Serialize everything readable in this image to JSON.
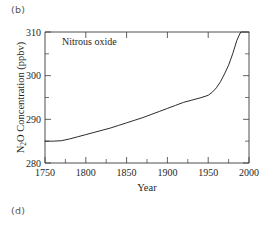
{
  "figure": {
    "panel_label_b": "(b)",
    "panel_label_d": "(d)"
  },
  "chart_data": {
    "type": "line",
    "title": "",
    "annotation": "Nitrous oxide",
    "xlabel": "Year",
    "ylabel_prefix": "N",
    "ylabel_subscript": "2",
    "ylabel_suffix": "O Concentration (ppbv)",
    "ylabel_full": "N2O Concentration (ppbv)",
    "xlim": [
      1750,
      2000
    ],
    "ylim": [
      280,
      310
    ],
    "grid": false,
    "legend": "none",
    "xticks": [
      1750,
      1800,
      1850,
      1900,
      1950,
      2000
    ],
    "xtick_labels": [
      "1750",
      "1800",
      "1850",
      "1900",
      "1950",
      "2000"
    ],
    "xticks_minor": [
      1775,
      1825,
      1875,
      1925,
      1975
    ],
    "yticks": [
      280,
      290,
      300,
      310
    ],
    "ytick_labels": [
      "280",
      "290",
      "300",
      "310"
    ],
    "yticks_minor": [
      285,
      295,
      305
    ],
    "line_color": "#2b2b2b",
    "axis_color": "#3a3a3a",
    "background_color": "#ffffff",
    "series": [
      {
        "name": "Nitrous oxide",
        "x": [
          1750,
          1760,
          1770,
          1780,
          1790,
          1800,
          1810,
          1820,
          1830,
          1840,
          1850,
          1860,
          1870,
          1880,
          1890,
          1900,
          1910,
          1920,
          1930,
          1940,
          1950,
          1955,
          1960,
          1965,
          1970,
          1975,
          1980,
          1985,
          1988,
          1990,
          2000
        ],
        "y": [
          285.0,
          285.0,
          285.1,
          285.5,
          286.0,
          286.5,
          287.0,
          287.5,
          288.0,
          288.6,
          289.2,
          289.8,
          290.4,
          291.1,
          291.8,
          292.5,
          293.2,
          293.9,
          294.4,
          294.9,
          295.5,
          296.2,
          297.2,
          298.6,
          300.4,
          302.4,
          305.0,
          308.0,
          309.3,
          310.0,
          310.0
        ]
      }
    ]
  }
}
